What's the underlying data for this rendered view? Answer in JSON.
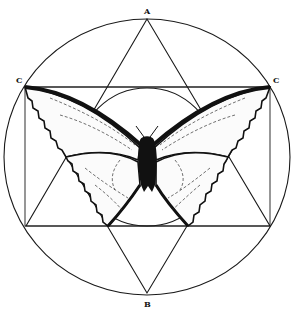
{
  "figure": {
    "labels": {
      "top_vertex": "A",
      "left_corner": "C",
      "right_corner": "C",
      "bottom_vertex": "B"
    },
    "colors": {
      "line": "#1a1a1a",
      "fill": "#111111",
      "background": "#ffffff"
    },
    "geometry": {
      "outer_circle": {
        "cx": 147,
        "cy": 157,
        "rx": 143,
        "ry": 138
      },
      "inner_circle": {
        "cx": 147,
        "cy": 157,
        "r": 69
      },
      "rectangle": {
        "x1": 25,
        "y1": 87,
        "x2": 270,
        "y2": 226
      },
      "up_triangle": [
        [
          147,
          19
        ],
        [
          26,
          226
        ],
        [
          270,
          226
        ]
      ],
      "down_triangle": [
        [
          25,
          87
        ],
        [
          270,
          87
        ],
        [
          147,
          293
        ]
      ]
    }
  }
}
